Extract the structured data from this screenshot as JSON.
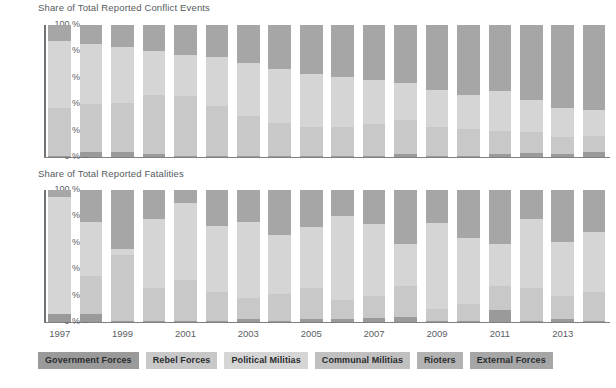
{
  "chart_data": [
    {
      "type": "bar",
      "stacked": true,
      "stack_mode": "percent",
      "title": "Share of Total Reported Conflict Events",
      "xlabel": "",
      "ylabel": "",
      "ylim": [
        0,
        100
      ],
      "ytick_labels": [
        "0 %",
        "20 %",
        "40 %",
        "60 %",
        "80 %",
        "100 %"
      ],
      "ytick_values": [
        0,
        20,
        40,
        60,
        80,
        100
      ],
      "grid": false,
      "legend_position": "bottom",
      "categories": [
        "1997",
        "1998",
        "1999",
        "2000",
        "2001",
        "2002",
        "2003",
        "2004",
        "2005",
        "2006",
        "2007",
        "2008",
        "2009",
        "2010",
        "2011",
        "2012",
        "2013",
        "2014"
      ],
      "tick_label_categories": [
        "1997",
        "",
        "1999",
        "",
        "2001",
        "",
        "2003",
        "",
        "2005",
        "",
        "2007",
        "",
        "2009",
        "",
        "2011",
        "",
        "2013",
        ""
      ],
      "series": [
        {
          "name": "Government Forces",
          "values": [
            1,
            4,
            4,
            2,
            1,
            1,
            1,
            1,
            1,
            1,
            1,
            2,
            1,
            1,
            2,
            3,
            2,
            4
          ]
        },
        {
          "name": "Rebel Forces",
          "values": [
            36,
            36,
            37,
            45,
            45,
            38,
            30,
            25,
            22,
            22,
            24,
            26,
            22,
            20,
            18,
            16,
            13,
            12
          ]
        },
        {
          "name": "Political Militias",
          "values": [
            51,
            46,
            42,
            33,
            31,
            37,
            40,
            41,
            40,
            38,
            33,
            28,
            28,
            26,
            30,
            24,
            22,
            20
          ]
        },
        {
          "name": "Communal Militias",
          "values": [
            0,
            0,
            0,
            0,
            0,
            0,
            0,
            0,
            0,
            0,
            0,
            0,
            0,
            0,
            0,
            0,
            0,
            0
          ]
        },
        {
          "name": "Rioters",
          "values": [
            0,
            0,
            0,
            0,
            0,
            0,
            0,
            0,
            0,
            0,
            0,
            0,
            0,
            0,
            0,
            0,
            0,
            0
          ]
        },
        {
          "name": "External Forces",
          "values": [
            12,
            14,
            17,
            20,
            23,
            24,
            29,
            33,
            37,
            39,
            42,
            44,
            49,
            53,
            50,
            57,
            63,
            64
          ]
        }
      ]
    },
    {
      "type": "bar",
      "stacked": true,
      "stack_mode": "percent",
      "title": "Share of Total Reported Fatalities",
      "xlabel": "",
      "ylabel": "",
      "ylim": [
        0,
        100
      ],
      "ytick_labels": [
        "0 %",
        "20 %",
        "40 %",
        "60 %",
        "80 %",
        "100 %"
      ],
      "ytick_values": [
        0,
        20,
        40,
        60,
        80,
        100
      ],
      "grid": false,
      "legend_position": "bottom",
      "categories": [
        "1997",
        "1998",
        "1999",
        "2000",
        "2001",
        "2002",
        "2003",
        "2004",
        "2005",
        "2006",
        "2007",
        "2008",
        "2009",
        "2010",
        "2011",
        "2012",
        "2013",
        "2014"
      ],
      "tick_label_categories": [
        "1997",
        "",
        "1999",
        "",
        "2001",
        "",
        "2003",
        "",
        "2005",
        "",
        "2007",
        "",
        "2009",
        "",
        "2011",
        "",
        "2013",
        ""
      ],
      "series": [
        {
          "name": "Government Forces",
          "values": [
            6,
            6,
            1,
            1,
            1,
            1,
            2,
            1,
            2,
            2,
            3,
            4,
            1,
            1,
            9,
            1,
            2,
            1
          ]
        },
        {
          "name": "Rebel Forces",
          "values": [
            0,
            29,
            50,
            25,
            31,
            22,
            16,
            20,
            24,
            15,
            17,
            23,
            9,
            13,
            18,
            25,
            18,
            22
          ]
        },
        {
          "name": "Political Militias",
          "values": [
            89,
            41,
            4,
            52,
            58,
            50,
            58,
            45,
            46,
            63,
            54,
            32,
            65,
            50,
            32,
            52,
            41,
            45
          ]
        },
        {
          "name": "Communal Militias",
          "values": [
            0,
            0,
            0,
            0,
            0,
            0,
            0,
            0,
            0,
            0,
            0,
            0,
            0,
            0,
            0,
            0,
            0,
            0
          ]
        },
        {
          "name": "Rioters",
          "values": [
            0,
            0,
            0,
            0,
            0,
            0,
            0,
            0,
            0,
            0,
            0,
            0,
            0,
            0,
            0,
            0,
            0,
            0
          ]
        },
        {
          "name": "External Forces",
          "values": [
            5,
            24,
            45,
            22,
            10,
            27,
            24,
            34,
            28,
            20,
            26,
            41,
            25,
            36,
            41,
            22,
            39,
            32
          ]
        }
      ]
    }
  ],
  "legend": {
    "items": [
      {
        "label": "Government Forces",
        "color": "#9a9a9a"
      },
      {
        "label": "Rebel Forces",
        "color": "#c8c8c8"
      },
      {
        "label": "Political Militias",
        "color": "#d5d5d5"
      },
      {
        "label": "Communal Militias",
        "color": "#c0c0c0"
      },
      {
        "label": "Rioters",
        "color": "#b2b2b2"
      },
      {
        "label": "External Forces",
        "color": "#a6a6a6"
      }
    ]
  },
  "palette": {
    "government_forces": "#9a9a9a",
    "rebel_forces": "#c8c8c8",
    "political_militias": "#d5d5d5",
    "communal_militias": "#c0c0c0",
    "rioters": "#b2b2b2",
    "external_forces": "#a6a6a6",
    "axis": "#6d7376",
    "text": "#5a6063",
    "background": "#ffffff"
  }
}
